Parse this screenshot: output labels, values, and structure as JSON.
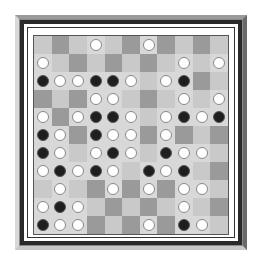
{
  "game": {
    "type": "board-game",
    "board_size": 11,
    "colors": {
      "light_square": "#c9c9c9",
      "dark_square": "#9a9a9a",
      "white_piece": "#ffffff",
      "black_piece": "#1e1e1e",
      "frame_dark": "#2a2a2a",
      "frame_bevel": "#8a8a8a"
    },
    "rows": [
      "...W..W....",
      "W.......W.W",
      "BWWBBW.WB..",
      "...WW...W.W",
      "W.WBBW.WBWB",
      "BW.BWW.W...",
      "BW.WBW.BWW.",
      "WBWBW.BWB..",
      ".W..W.W.WW.",
      "WBW.....W..",
      "BWW...W.BW."
    ]
  }
}
